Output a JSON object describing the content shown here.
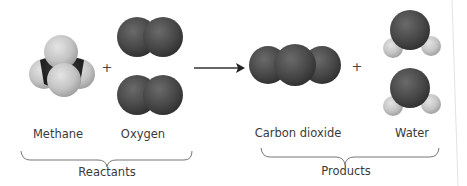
{
  "diagram": {
    "reactants": {
      "group_label": "Reactants",
      "molecules": [
        {
          "name": "Methane",
          "count": 1
        },
        {
          "name": "Oxygen",
          "count": 2
        }
      ]
    },
    "products": {
      "group_label": "Products",
      "molecules": [
        {
          "name": "Carbon dioxide",
          "count": 1
        },
        {
          "name": "Water",
          "count": 2
        }
      ]
    },
    "operators": {
      "plus": "+",
      "arrow": "→"
    },
    "colors": {
      "oxygen_atom": "#4a4a4a",
      "hydrogen_atom": "#c8c8c8",
      "carbon_atom": "#2b2b2b",
      "brace": "#777777",
      "text": "#3a3a3a"
    }
  }
}
